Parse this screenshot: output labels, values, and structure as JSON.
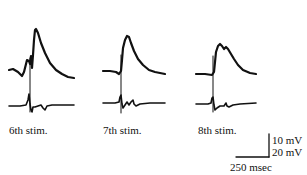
{
  "figure": {
    "panels": [
      {
        "label": "6th stim."
      },
      {
        "label": "7th stim."
      },
      {
        "label": "8th stim."
      }
    ],
    "scale_bar": {
      "vertical_top": "10 mV",
      "vertical_bottom": "20 mV",
      "horizontal": "250 msec"
    },
    "colors": {
      "trace": "#111111",
      "background": "#ffffff"
    }
  }
}
